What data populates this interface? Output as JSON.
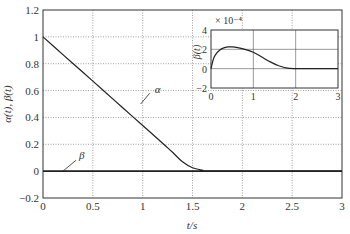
{
  "chart_data": {
    "type": "line",
    "title": "",
    "xlabel": "t/s",
    "ylabel": "α(t), β(t)",
    "xlim": [
      0,
      3
    ],
    "ylim": [
      -0.2,
      1.2
    ],
    "xticks": [
      "0",
      "0.5",
      "1",
      "1.5",
      "2",
      "2.5",
      "3"
    ],
    "yticks": [
      "-0.2",
      "0",
      "0.2",
      "0.4",
      "0.6",
      "0.8",
      "1",
      "1.2"
    ],
    "grid": true,
    "series": [
      {
        "name": "α",
        "x": [
          0,
          0.2,
          0.4,
          0.6,
          0.8,
          1.0,
          1.2,
          1.3,
          1.4,
          1.5,
          1.6,
          1.7,
          3.0
        ],
        "values": [
          1.0,
          0.868,
          0.736,
          0.604,
          0.472,
          0.34,
          0.208,
          0.14,
          0.07,
          0.025,
          0.008,
          0.0,
          0.0
        ]
      },
      {
        "name": "β",
        "x": [
          0,
          3
        ],
        "values": [
          0,
          0
        ]
      }
    ],
    "annotations": [
      {
        "text": "α",
        "x": 1.0,
        "y": 0.62
      },
      {
        "text": "β",
        "x": 0.45,
        "y": 0.12
      }
    ],
    "inset": {
      "ylabel": "β(t)",
      "scale_label": "× 10⁻⁴",
      "xlim": [
        0,
        3
      ],
      "ylim": [
        -2,
        4
      ],
      "xticks": [
        "0",
        "1",
        "2",
        "3"
      ],
      "yticks": [
        "-2",
        "0",
        "2",
        "4"
      ],
      "grid": true,
      "series": [
        {
          "name": "β",
          "x": [
            0,
            0.05,
            0.1,
            0.2,
            0.3,
            0.4,
            0.5,
            0.6,
            0.8,
            1.0,
            1.2,
            1.4,
            1.6,
            1.8,
            2.0,
            2.5,
            3.0
          ],
          "values": [
            0,
            0.9,
            1.4,
            1.9,
            2.15,
            2.25,
            2.25,
            2.2,
            2.0,
            1.7,
            1.2,
            0.7,
            0.3,
            0.05,
            0,
            0,
            0
          ]
        }
      ]
    }
  }
}
